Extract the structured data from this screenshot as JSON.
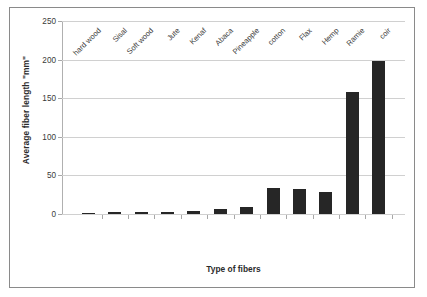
{
  "chart_data": {
    "type": "bar",
    "title": "",
    "xlabel": "Type of fibers",
    "ylabel": "Average fiber length \"mm\"",
    "categories": [
      "hard wood",
      "Sisal",
      "Soft wood",
      "Jute",
      "Kenaf",
      "Abaca",
      "Pineapple",
      "cotton",
      "Flax",
      "Hemp",
      "Ramie",
      "coir"
    ],
    "values": [
      1,
      3,
      2.5,
      3,
      3.5,
      6,
      9,
      34,
      32,
      29,
      158,
      198
    ],
    "ylim": [
      0,
      250
    ],
    "yticks": [
      0,
      50,
      100,
      150,
      200,
      250
    ],
    "ytick_labels": [
      "0",
      "50",
      "100",
      "150",
      "200",
      "250"
    ],
    "grid": true,
    "legend": false,
    "bar_color": "#262626"
  }
}
